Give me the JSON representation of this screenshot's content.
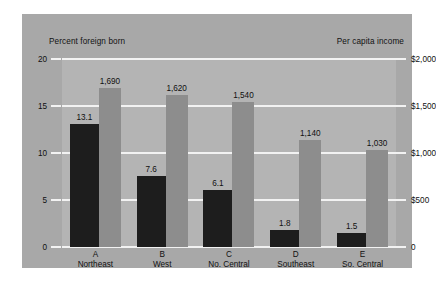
{
  "header": {
    "left_axis_title": "Percent foreign born",
    "right_axis_title": "Per capita income"
  },
  "chart_data": {
    "type": "bar",
    "title": "",
    "subtitle": "",
    "categories": [
      "A",
      "B",
      "C",
      "D",
      "E"
    ],
    "category_names": [
      "Northeast",
      "West",
      "No. Central",
      "Southeast",
      "So. Central"
    ],
    "series": [
      {
        "name": "Percent foreign born",
        "axis": "left",
        "color": "#1d1d1d",
        "values": [
          13.1,
          7.6,
          6.1,
          1.8,
          1.5
        ],
        "labels": [
          "13.1",
          "7.6",
          "6.1",
          "1.8",
          "1.5"
        ]
      },
      {
        "name": "Per capita income",
        "axis": "right",
        "color": "#8d8d8d",
        "values": [
          1690,
          1620,
          1540,
          1140,
          1030
        ],
        "labels": [
          "1,690",
          "1,620",
          "1,540",
          "1,140",
          "1,030"
        ]
      }
    ],
    "xlabel": "",
    "ylabel": "Percent foreign born",
    "y2label": "Per capita income",
    "ylim": [
      0,
      20
    ],
    "y2lim": [
      0,
      2000
    ],
    "yticks": [
      0,
      5,
      10,
      15,
      20
    ],
    "yticklabels": [
      "0",
      "5",
      "10",
      "15",
      "20"
    ],
    "y2ticks": [
      0,
      500,
      1000,
      1500,
      2000
    ],
    "y2ticklabels": [
      "0",
      "$500",
      "$1,000",
      "$1,500",
      "$2,000"
    ],
    "grid": true,
    "legend": "none",
    "gridline_color": "#f2f2f2",
    "plot_background": "#b4b4b4",
    "panel_background": "#a8a8a8"
  }
}
